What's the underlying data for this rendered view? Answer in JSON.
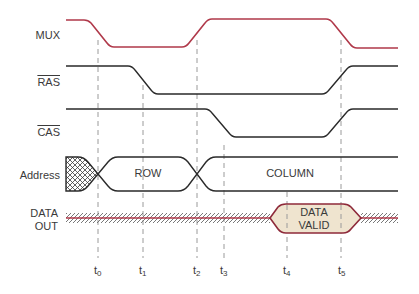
{
  "diagram": {
    "colors": {
      "mux_line": "#b0394a",
      "signal_line": "#2a2a2a",
      "data_line": "#b0394a",
      "data_valid_fill": "#efe4cf",
      "data_valid_border": "#8e2a3a",
      "dashed_guide": "#9a9a9a",
      "hatch": "#6a6a6a",
      "text": "#3a3a3a"
    },
    "signals": [
      {
        "id": "mux",
        "label": "MUX",
        "overline": false
      },
      {
        "id": "ras",
        "label": "RAS",
        "overline": true
      },
      {
        "id": "cas",
        "label": "CAS",
        "overline": true
      },
      {
        "id": "address",
        "label": "Address",
        "overline": false
      },
      {
        "id": "data_out",
        "label_line1": "DATA",
        "label_line2": "OUT",
        "overline": false
      }
    ],
    "address_segments": [
      {
        "label": "ROW"
      },
      {
        "label": "COLUMN"
      }
    ],
    "data_valid": {
      "line1": "DATA",
      "line2": "VALID"
    },
    "time_markers": [
      {
        "base": "t",
        "sub": "0"
      },
      {
        "base": "t",
        "sub": "1"
      },
      {
        "base": "t",
        "sub": "2"
      },
      {
        "base": "t",
        "sub": "3"
      },
      {
        "base": "t",
        "sub": "4"
      },
      {
        "base": "t",
        "sub": "5"
      }
    ]
  }
}
